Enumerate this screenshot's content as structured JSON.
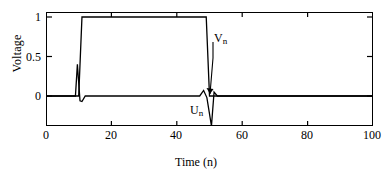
{
  "chart_data": {
    "type": "line",
    "title": "",
    "xlabel": "Time (n)",
    "ylabel": "Voltage",
    "xlim": [
      0,
      100
    ],
    "ylim": [
      -0.38,
      1.06
    ],
    "grid": false,
    "legend_position": "inline-annotations",
    "xticks": [
      0,
      20,
      40,
      60,
      80,
      100
    ],
    "xtick_labels": [
      "0",
      "20",
      "40",
      "60",
      "80",
      "100"
    ],
    "yticks": [
      0,
      0.5,
      1
    ],
    "ytick_labels": [
      "0",
      "0.5",
      "1"
    ],
    "annotations": [
      {
        "name": "V_n",
        "text": "V",
        "sub": "n",
        "x": 52,
        "y": 0.78
      },
      {
        "name": "U_n",
        "text": "U",
        "sub": "n",
        "x": 44,
        "y": -0.12
      }
    ],
    "series": [
      {
        "name": "V_n",
        "label": "V",
        "sublabel": "n",
        "color": "#000000",
        "description": "Unit step pulse: 0 from n=0 to n=10, rises to 1 at n=11, holds 1 until n=49, falls to 0 at n=50, stays 0 to n=100",
        "x": [
          0,
          10,
          11,
          49,
          50,
          100
        ],
        "values": [
          0,
          0,
          1,
          1,
          0,
          0
        ]
      },
      {
        "name": "U_n",
        "label": "U",
        "sublabel": "n",
        "color": "#000000",
        "description": "Impulse/derivative signal: flat 0 with a positive spike to 0.40 at n=9.5 followed by a negative dip to -0.07 at n=11; then a small positive bump to 0.07 at n=48 followed by a large negative spike to -0.38 at n=50.5, returning to 0",
        "x": [
          0,
          9.0,
          9.6,
          10.4,
          11.0,
          12.0,
          47.0,
          48.2,
          49.2,
          50.6,
          51.4,
          52.4,
          100
        ],
        "values": [
          0,
          0,
          0.4,
          -0.06,
          -0.07,
          0,
          0,
          0.07,
          -0.02,
          -0.38,
          0.05,
          0,
          0
        ]
      }
    ]
  }
}
